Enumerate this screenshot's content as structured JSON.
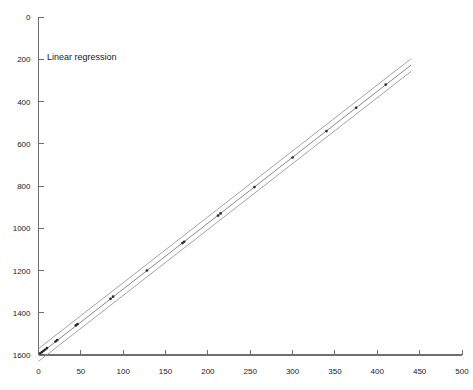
{
  "chart_data": {
    "type": "scatter",
    "title": "",
    "annotation": "Linear regression",
    "xlabel": "",
    "ylabel": "",
    "xlim": [
      0,
      500
    ],
    "ylim": [
      0,
      1600
    ],
    "xticks": [
      0,
      50,
      100,
      150,
      200,
      250,
      300,
      350,
      400,
      450,
      500
    ],
    "yticks": [
      0,
      200,
      400,
      600,
      800,
      1000,
      1200,
      1400,
      1600
    ],
    "grid": false,
    "legend_position": "none",
    "series": [
      {
        "name": "Observations",
        "type": "scatter",
        "x": [
          2,
          4,
          6,
          8,
          10,
          20,
          22,
          44,
          46,
          85,
          88,
          128,
          170,
          172,
          212,
          215,
          255,
          300,
          340,
          375,
          410
        ],
        "y": [
          8,
          14,
          20,
          26,
          33,
          64,
          70,
          140,
          146,
          266,
          276,
          400,
          530,
          536,
          660,
          670,
          795,
          935,
          1060,
          1170,
          1280
        ]
      },
      {
        "name": "Regression line",
        "type": "line",
        "slope": 3.12,
        "intercept": 0,
        "x": [
          0,
          440
        ],
        "y": [
          0,
          1373
        ]
      },
      {
        "name": "Upper confidence band",
        "type": "line",
        "slope": 3.12,
        "intercept": 30,
        "x": [
          0,
          440
        ],
        "y": [
          30,
          1403
        ]
      },
      {
        "name": "Lower confidence band",
        "type": "line",
        "slope": 3.12,
        "intercept": -30,
        "x": [
          0,
          440
        ],
        "y": [
          -30,
          1343
        ]
      }
    ]
  },
  "axes": {
    "y_tick_labels": [
      "1600",
      "1400",
      "1200",
      "1000",
      "800",
      "600",
      "400",
      "200",
      "0"
    ],
    "x_tick_labels": [
      "0",
      "50",
      "100",
      "150",
      "200",
      "250",
      "300",
      "350",
      "400",
      "450",
      "500"
    ]
  },
  "colors": {
    "background": "#ffffff",
    "axis": "#6e6e6e",
    "fit_line": "#8a8a8a",
    "band_line": "#9a9a9a",
    "point": "#2b2b2b",
    "text": "#1a1a1a"
  }
}
